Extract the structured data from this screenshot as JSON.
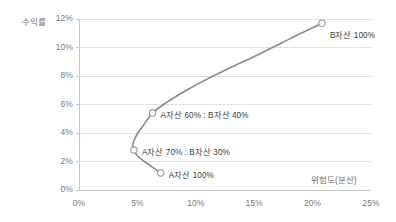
{
  "chart_data": {
    "type": "line",
    "title": "",
    "xlabel": "위험도(분산)",
    "ylabel": "수익률",
    "xlim": [
      0,
      25
    ],
    "ylim": [
      0,
      12
    ],
    "x_ticks": [
      "0%",
      "5%",
      "10%",
      "15%",
      "20%",
      "25%"
    ],
    "x_tick_values": [
      0,
      5,
      10,
      15,
      20,
      25
    ],
    "y_ticks": [
      "0%",
      "2%",
      "4%",
      "6%",
      "8%",
      "10%",
      "12%"
    ],
    "y_tick_values": [
      0,
      2,
      4,
      6,
      8,
      10,
      12
    ],
    "grid": "horizontal",
    "legend": "none",
    "series": [
      {
        "name": "efficient-frontier",
        "color": "#8a8a8a",
        "x": [
          7.0,
          6.3,
          5.6,
          5.0,
          4.7,
          4.6,
          4.9,
          5.4,
          6.3,
          7.6,
          9.2,
          11.0,
          13.0,
          15.1,
          17.3,
          19.0,
          20.8
        ],
        "y": [
          1.2,
          1.6,
          2.0,
          2.4,
          2.8,
          3.2,
          3.8,
          4.4,
          5.4,
          6.2,
          7.0,
          7.8,
          8.6,
          9.4,
          10.3,
          11.0,
          11.7
        ]
      }
    ],
    "annotated_points": [
      {
        "id": "b-asset-100",
        "label": "B자산 100%",
        "x": 20.8,
        "y": 11.7,
        "label_dx": 8,
        "label_dy": 10
      },
      {
        "id": "a60-b40",
        "label": "A자산 60% : B자산 40%",
        "x": 6.3,
        "y": 5.4,
        "label_dx": 8,
        "label_dy": 0
      },
      {
        "id": "a70-b30",
        "label": "A자산 70% : B자산 30%",
        "x": 4.7,
        "y": 2.8,
        "label_dx": 8,
        "label_dy": 0
      },
      {
        "id": "a-asset-100",
        "label": "A자산 100%",
        "x": 7.0,
        "y": 1.2,
        "label_dx": 8,
        "label_dy": 0
      }
    ],
    "marker_style": {
      "shape": "circle-open",
      "radius": 3.2,
      "stroke": "#9a9a9a",
      "fill": "#ffffff"
    },
    "colors": {
      "line": "#8a8a8a",
      "grid": "#e2e2e2",
      "axis": "#c9c9c9",
      "tick_text": "#7a7a7a",
      "label_text": "#3c3c3c",
      "background": "#ffffff"
    }
  }
}
